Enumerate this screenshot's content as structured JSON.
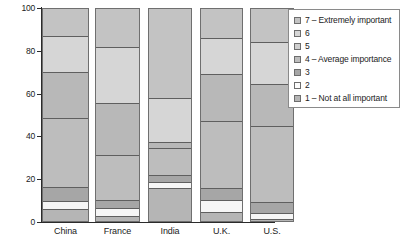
{
  "chart_data": {
    "type": "bar",
    "subtype": "stacked-percentage",
    "title": "",
    "xlabel": "",
    "ylabel": "",
    "ylim": [
      0,
      100
    ],
    "yticks": [
      0,
      20,
      40,
      60,
      80,
      100
    ],
    "grid": false,
    "legend_position": "right",
    "categories": [
      "China",
      "France",
      "India",
      "U.K.",
      "U.S."
    ],
    "series": [
      {
        "name": "7 - Extremely important",
        "values": [
          13.0,
          18.0,
          42.0,
          14.0,
          16.0
        ],
        "color": "#c3c3c3"
      },
      {
        "name": "6",
        "values": [
          17.0,
          26.5,
          20.5,
          17.0,
          19.5
        ],
        "color": "#d6d6d6"
      },
      {
        "name": "5",
        "values": [
          21.5,
          24.0,
          3.0,
          22.0,
          19.5
        ],
        "color": "#b8b8b8"
      },
      {
        "name": "4 - Average importance",
        "values": [
          32.0,
          21.0,
          12.5,
          31.0,
          35.5
        ],
        "color": "#bdbdbd"
      },
      {
        "name": "3",
        "values": [
          6.5,
          4.0,
          3.5,
          5.5,
          5.5
        ],
        "color": "#a6a6a6"
      },
      {
        "name": "2",
        "values": [
          4.0,
          3.5,
          2.5,
          6.0,
          2.5
        ],
        "color": "#f6f6f6"
      },
      {
        "name": "1 - Not at all important",
        "values": [
          6.0,
          3.0,
          16.0,
          4.5,
          1.5
        ],
        "color": "#b5b5b5"
      }
    ]
  },
  "axis": {
    "y_tick_labels": [
      "100",
      "80",
      "60",
      "40",
      "20",
      "0"
    ]
  },
  "legend": {
    "items": [
      {
        "label": "7 – Extremely important",
        "swatch": "#c3c3c3"
      },
      {
        "label": "6",
        "swatch": "#d6d6d6"
      },
      {
        "label": "5",
        "swatch": "#cfcfcf"
      },
      {
        "label": "4 – Average importance",
        "swatch": "#bdbdbd"
      },
      {
        "label": "3",
        "swatch": "#a6a6a6"
      },
      {
        "label": "2",
        "swatch": "#fcfcfc"
      },
      {
        "label": "1 – Not at all important",
        "swatch": "#b5b5b5"
      }
    ]
  },
  "caption": {
    "text": ""
  }
}
